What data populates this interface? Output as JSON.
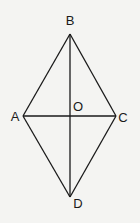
{
  "diagram": {
    "type": "rhombus-with-diagonals",
    "stroke_color": "#1a1a1a",
    "background": "#f4f4f2",
    "vertices": [
      {
        "label": "B",
        "x": 70,
        "y": 34,
        "lx": 70,
        "ly": 25,
        "anchor": "middle"
      },
      {
        "label": "A",
        "x": 23,
        "y": 116,
        "lx": 15,
        "ly": 121,
        "anchor": "middle"
      },
      {
        "label": "C",
        "x": 116,
        "y": 116,
        "lx": 123,
        "ly": 122,
        "anchor": "middle"
      },
      {
        "label": "D",
        "x": 70,
        "y": 197,
        "lx": 78,
        "ly": 208,
        "anchor": "middle"
      }
    ],
    "center": {
      "label": "O",
      "x": 70,
      "y": 116,
      "lx": 78,
      "ly": 111,
      "anchor": "middle"
    },
    "edges": [
      [
        "A",
        "B"
      ],
      [
        "B",
        "C"
      ],
      [
        "C",
        "D"
      ],
      [
        "D",
        "A"
      ]
    ],
    "diagonals": [
      [
        "A",
        "C"
      ],
      [
        "B",
        "D"
      ]
    ]
  }
}
